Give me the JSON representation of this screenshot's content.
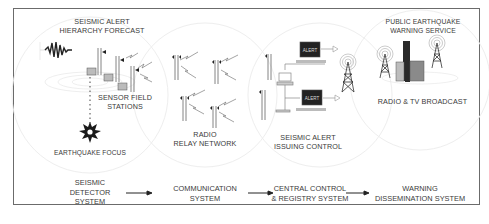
{
  "diagram": {
    "title_labels": {
      "forecast": [
        "SEISMIC ALERT",
        "HIERARCHY FORECAST"
      ],
      "sensor_stations": [
        "SENSOR FIELD",
        "STATIONS"
      ],
      "earthquake_focus": "EARTHQUAKE FOCUS",
      "relay_network": [
        "RADIO",
        "RELAY NETWORK"
      ],
      "issuing_control": [
        "SEISMIC ALERT",
        "ISSUING CONTROL"
      ],
      "public_service": [
        "PUBLIC EARTHQUAKE",
        "WARNING SERVICE"
      ],
      "broadcast": "RADIO & TV BROADCAST",
      "alert_screen_label": "ALERT"
    },
    "stages": [
      {
        "lines": [
          "SEISMIC",
          "DETECTOR",
          "SYSTEM"
        ]
      },
      {
        "lines": [
          "COMMUNICATION",
          "SYSTEM"
        ]
      },
      {
        "lines": [
          "CENTRAL CONTROL",
          "& REGISTRY SYSTEM"
        ]
      },
      {
        "lines": [
          "WARNING",
          "DISSEMINATION SYSTEM"
        ]
      }
    ],
    "flow_arrows": [
      "detector-to-communication",
      "communication-to-central",
      "central-to-warning"
    ],
    "colors": {
      "frame": "#6b6b6b",
      "text": "#3a3a3a",
      "screen": "#222222",
      "building_dark": "#2a2a2a",
      "building_gray": "#8a8a8a"
    }
  }
}
